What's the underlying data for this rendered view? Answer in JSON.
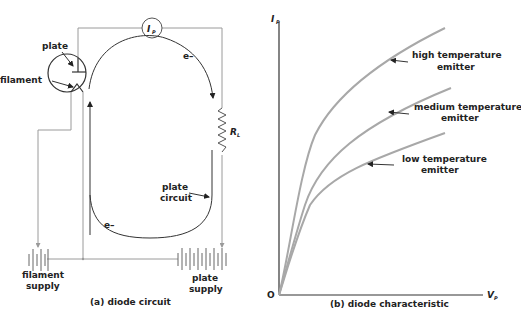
{
  "colors": {
    "wire": "#9a9a9a",
    "ink": "#222222",
    "curve": "#a8a8a8",
    "background": "#ffffff"
  },
  "circuit": {
    "caption": "(a) diode circuit",
    "ammeter_label": "I",
    "ammeter_sub": "P",
    "plate_label": "plate",
    "filament_label": "filament",
    "electron_top_label": "e–",
    "electron_bottom_label": "e–",
    "resistor_label": "R",
    "resistor_sub": "L",
    "plate_circuit_label_line1": "plate",
    "plate_circuit_label_line2": "circuit",
    "filament_supply_line1": "filament",
    "filament_supply_line2": "supply",
    "plate_supply_line1": "plate",
    "plate_supply_line2": "supply"
  },
  "graph": {
    "caption": "(b) diode characteristic",
    "y_axis_label": "I",
    "y_axis_sub": "P",
    "x_axis_label": "V",
    "x_axis_sub": "P",
    "origin_label": "O",
    "curves": [
      {
        "name": "high-temperature",
        "line1": "high  temperature",
        "line2": "emitter"
      },
      {
        "name": "medium-temperature",
        "line1": "medium  temperature",
        "line2": "emitter"
      },
      {
        "name": "low-temperature",
        "line1": "low  temperature",
        "line2": "emitter"
      }
    ]
  }
}
